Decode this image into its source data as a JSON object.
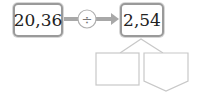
{
  "diagram": {
    "input_value": "20,36",
    "operator": "÷",
    "output_value": "2,54",
    "answer_boxes": [
      "",
      ""
    ]
  },
  "colors": {
    "box_border": "#9a9a9a",
    "arrow": "#a8a8a8",
    "answer_outline": "#c8c8c8"
  }
}
